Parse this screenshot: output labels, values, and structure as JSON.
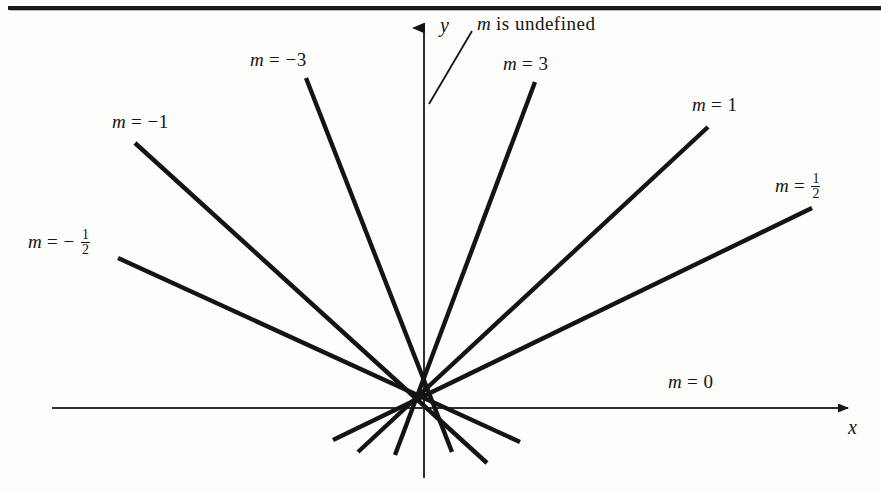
{
  "figure": {
    "type": "slope-illustration",
    "background_color": "#fdfdfc",
    "ink_color": "#141414",
    "axes": {
      "x_axis_label": "x",
      "y_axis_label": "y",
      "origin": {
        "x": 424,
        "y": 408
      },
      "x_axis_from": {
        "x": 52,
        "y": 408
      },
      "x_axis_to": {
        "x": 858,
        "y": 408
      },
      "y_axis_from": {
        "x": 424,
        "y": 478
      },
      "y_axis_to": {
        "x": 424,
        "y": 18
      },
      "x_arrow": true,
      "y_arrow": true
    },
    "labels": [
      {
        "name": "m-undefined",
        "text_m": "m",
        "text_rest": " is undefined",
        "slope": "undefined",
        "x": 477,
        "y": 14
      },
      {
        "name": "m-equals-minus-3",
        "text_m": "m",
        "text_rest": " = −3",
        "slope": -3,
        "x": 250,
        "y": 50
      },
      {
        "name": "m-equals-3",
        "text_m": "m",
        "text_rest": " = 3",
        "slope": 3,
        "x": 503,
        "y": 54
      },
      {
        "name": "m-equals-minus-1",
        "text_m": "m",
        "text_rest": " = −1",
        "slope": -1,
        "x": 112,
        "y": 112
      },
      {
        "name": "m-equals-1",
        "text_m": "m",
        "text_rest": " = 1",
        "slope": 1,
        "x": 692,
        "y": 95
      },
      {
        "name": "m-equals-one-half",
        "text_m": "m",
        "text_rest": " = ",
        "fraction_num": "1",
        "fraction_den": "2",
        "slope": 0.5,
        "x": 775,
        "y": 173
      },
      {
        "name": "m-equals-minus-one-half",
        "text_m": "m",
        "text_rest": " = − ",
        "fraction_num": "1",
        "fraction_den": "2",
        "slope": -0.5,
        "x": 28,
        "y": 229
      },
      {
        "name": "m-equals-0",
        "text_m": "m",
        "text_rest": " = 0",
        "slope": 0,
        "x": 668,
        "y": 372
      }
    ],
    "lines": [
      {
        "name": "line-slope-undefined",
        "slope": "undefined",
        "x1": 424,
        "y1": 18,
        "x2": 424,
        "y2": 478
      },
      {
        "name": "line-slope-minus-3",
        "slope": -3,
        "x1": 306,
        "y1": 78,
        "x2": 452,
        "y2": 452
      },
      {
        "name": "line-slope-3",
        "slope": 3,
        "x1": 535,
        "y1": 82,
        "x2": 395,
        "y2": 455
      },
      {
        "name": "line-slope-minus-1",
        "slope": -1,
        "x1": 135,
        "y1": 143,
        "x2": 487,
        "y2": 463
      },
      {
        "name": "line-slope-1",
        "slope": 1,
        "x1": 708,
        "y1": 127,
        "x2": 358,
        "y2": 452
      },
      {
        "name": "line-slope-one-half",
        "slope": 0.5,
        "x1": 812,
        "y1": 208,
        "x2": 333,
        "y2": 440
      },
      {
        "name": "line-slope-minus-one-half",
        "slope": -0.5,
        "x1": 118,
        "y1": 258,
        "x2": 520,
        "y2": 442
      },
      {
        "name": "line-slope-0-x-axis",
        "slope": 0,
        "x1": 52,
        "y1": 408,
        "x2": 858,
        "y2": 408
      }
    ],
    "leader": {
      "name": "undefined-leader-line",
      "x1": 472,
      "y1": 31,
      "x2": 429,
      "y2": 104
    }
  }
}
